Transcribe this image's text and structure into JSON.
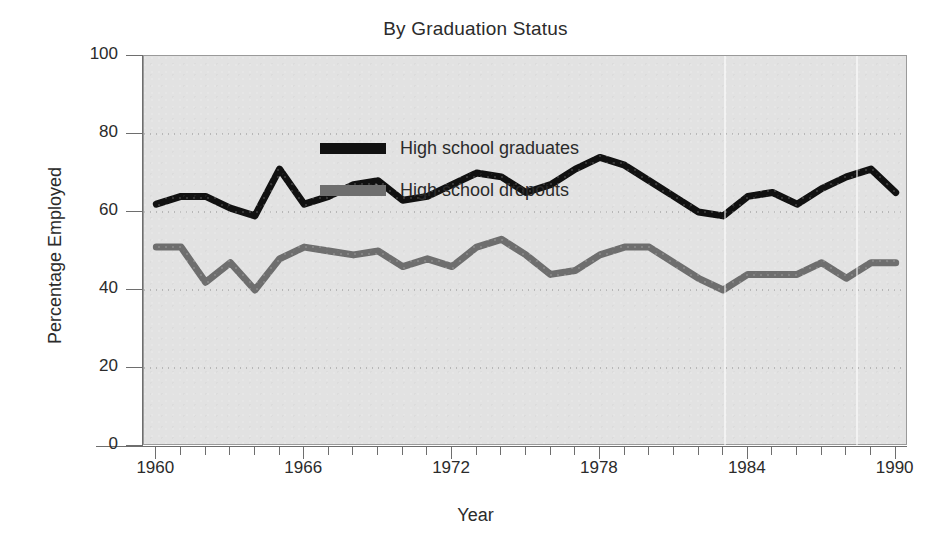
{
  "chart_data": {
    "type": "line",
    "title": "By Graduation Status",
    "xlabel": "Year",
    "ylabel": "Percentage Employed",
    "xlim": [
      1959.5,
      1990.5
    ],
    "ylim": [
      0,
      100
    ],
    "grid": true,
    "grid_style": "dotted horizontal",
    "legend_position": "top-left inside plot",
    "xticks_major": [
      1960,
      1966,
      1972,
      1978,
      1984,
      1990
    ],
    "xticks_minor_step": 1,
    "yticks": [
      0,
      20,
      40,
      60,
      80,
      100
    ],
    "x": [
      1960,
      1961,
      1962,
      1963,
      1964,
      1965,
      1966,
      1967,
      1968,
      1969,
      1970,
      1971,
      1972,
      1973,
      1974,
      1975,
      1976,
      1977,
      1978,
      1979,
      1980,
      1981,
      1982,
      1983,
      1984,
      1985,
      1986,
      1987,
      1988,
      1989,
      1990
    ],
    "series": [
      {
        "name": "High school graduates",
        "color": "#111111",
        "values": [
          62,
          64,
          64,
          61,
          59,
          71,
          62,
          64,
          67,
          68,
          63,
          64,
          67,
          70,
          69,
          65,
          67,
          71,
          74,
          72,
          68,
          64,
          60,
          59,
          64,
          65,
          62,
          66,
          69,
          71,
          65
        ]
      },
      {
        "name": "High school dropouts",
        "color": "#6e6e6e",
        "values": [
          51,
          51,
          42,
          47,
          40,
          48,
          51,
          50,
          49,
          50,
          46,
          48,
          46,
          51,
          53,
          49,
          44,
          45,
          49,
          51,
          51,
          47,
          43,
          40,
          44,
          44,
          44,
          47,
          43,
          47,
          47
        ]
      }
    ]
  },
  "chart": {
    "title": "By Graduation Status",
    "xlabel": "Year",
    "ylabel": "Percentage Employed",
    "ytick_labels": [
      "100",
      "80",
      "60",
      "40",
      "20",
      "0"
    ],
    "xtick_labels": [
      "1960",
      "1966",
      "1972",
      "1978",
      "1984",
      "1990"
    ],
    "legend": [
      {
        "label": "High school graduates",
        "color": "#111111"
      },
      {
        "label": "High school dropouts",
        "color": "#6e6e6e"
      }
    ],
    "colors": {
      "plot_background": "#e2e2e2",
      "page_background": "#ffffff",
      "axis": "#6e6e6e",
      "text": "#2b2b2b",
      "graduates": "#111111",
      "dropouts": "#6e6e6e"
    }
  }
}
